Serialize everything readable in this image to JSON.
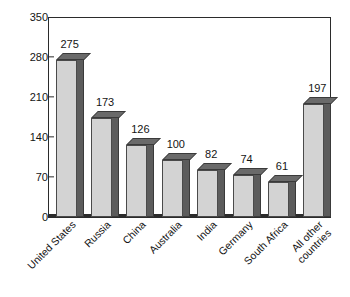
{
  "chart_data": {
    "type": "bar",
    "title": "",
    "xlabel": "",
    "ylabel": "Billion short tons",
    "ylim": [
      0,
      350
    ],
    "yticks": [
      0,
      70,
      140,
      210,
      280,
      350
    ],
    "ytick_labels": [
      "0",
      "70",
      "140",
      "210",
      "280",
      "350"
    ],
    "grid": false,
    "legend": "none",
    "categories": [
      "United States",
      "Russia",
      "China",
      "Australia",
      "India",
      "Germany",
      "South Africa",
      "All other countries"
    ],
    "category_lines": [
      [
        "United States"
      ],
      [
        "Russia"
      ],
      [
        "China"
      ],
      [
        "Australia"
      ],
      [
        "India"
      ],
      [
        "Germany"
      ],
      [
        "South Africa"
      ],
      [
        "All other",
        "countries"
      ]
    ],
    "values": [
      275,
      173,
      126,
      100,
      82,
      74,
      61,
      197
    ],
    "value_labels": [
      "275",
      "173",
      "126",
      "100",
      "82",
      "74",
      "61",
      "197"
    ],
    "style": {
      "bar_front_color": "#d3d3d3",
      "bar_side_color": "#5c5c5c",
      "bar_top_color": "#6a6a6a",
      "bar_outline_color": "#3a3a3a",
      "axis_color": "#2b2b2b",
      "text_color": "#141414",
      "background": "#ffffff",
      "three_d": true
    }
  }
}
